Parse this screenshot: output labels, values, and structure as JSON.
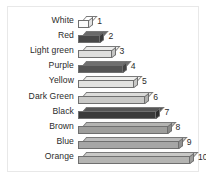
{
  "chart_data": {
    "type": "bar",
    "orientation": "horizontal",
    "style": "3d-blocks",
    "title": "",
    "xlabel": "",
    "ylabel": "",
    "grid": false,
    "legend": null,
    "xlim": [
      0,
      10
    ],
    "categories": [
      "White",
      "Red",
      "Light green",
      "Purple",
      "Yellow",
      "Dark Green",
      "Black",
      "Brown",
      "Blue",
      "Orange"
    ],
    "values": [
      1,
      2,
      3,
      4,
      5,
      6,
      7,
      8,
      9,
      10
    ],
    "value_labels": [
      "1",
      "2",
      "3",
      "4",
      "5",
      "6",
      "7",
      "8",
      "9",
      "10"
    ],
    "bars": [
      {
        "label": "White",
        "value": 1,
        "value_label": "1",
        "front_color": "#fbfbfb",
        "top_color": "#ffffff",
        "side_color": "#e2e2e2"
      },
      {
        "label": "Red",
        "value": 2,
        "value_label": "2",
        "front_color": "#484848",
        "top_color": "#6a6a6a",
        "side_color": "#3a3a3a"
      },
      {
        "label": "Light green",
        "value": 3,
        "value_label": "3",
        "front_color": "#dededd",
        "top_color": "#ececeb",
        "side_color": "#c4c4c3"
      },
      {
        "label": "Purple",
        "value": 4,
        "value_label": "4",
        "front_color": "#545454",
        "top_color": "#6f6f6f",
        "side_color": "#434343"
      },
      {
        "label": "Yellow",
        "value": 5,
        "value_label": "5",
        "front_color": "#e2e2e0",
        "top_color": "#efefed",
        "side_color": "#c8c8c6"
      },
      {
        "label": "Dark Green",
        "value": 6,
        "value_label": "6",
        "front_color": "#c9c9c7",
        "top_color": "#dcdcda",
        "side_color": "#b0b0ae"
      },
      {
        "label": "Black",
        "value": 7,
        "value_label": "7",
        "front_color": "#3a3a3a",
        "top_color": "#565656",
        "side_color": "#2d2d2d"
      },
      {
        "label": "Brown",
        "value": 8,
        "value_label": "8",
        "front_color": "#9e9e9c",
        "top_color": "#b4b4b2",
        "side_color": "#8a8a88"
      },
      {
        "label": "Blue",
        "value": 9,
        "value_label": "9",
        "front_color": "#a6a6a6",
        "top_color": "#bcbcbc",
        "side_color": "#919191"
      },
      {
        "label": "Orange",
        "value": 10,
        "value_label": "10",
        "front_color": "#b4b4b2",
        "top_color": "#c8c8c6",
        "side_color": "#9d9d9b"
      }
    ]
  },
  "colors": {
    "background": "#ffffff",
    "frame_border": "#e8e8e8",
    "text": "#2b2b2b",
    "bar_outline": "#6f6f6f"
  }
}
